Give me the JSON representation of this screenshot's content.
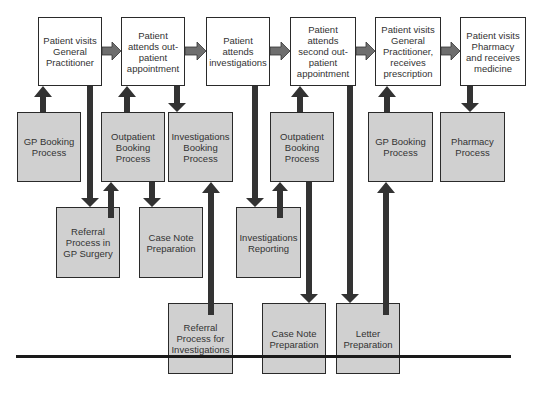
{
  "stages": [
    {
      "label": "Patient visits General Practitioner"
    },
    {
      "label": "Patient attends out-patient appointment"
    },
    {
      "label": "Patient attends investigations"
    },
    {
      "label": "Patient attends second out-patient appointment"
    },
    {
      "label": "Patient visits General Practitioner, receives prescription"
    },
    {
      "label": "Patient visits Pharmacy and receives medicine"
    }
  ],
  "processes": {
    "gp_booking_1": "GP Booking Process",
    "outpatient_booking_1": "Outpatient Booking Process",
    "investigations_booking": "Investigations Booking Process",
    "outpatient_booking_2": "Outpatient Booking Process",
    "gp_booking_2": "GP Booking Process",
    "pharmacy": "Pharmacy Process",
    "referral_gp": "Referral Process in GP Surgery",
    "case_note_1": "Case Note Preparation",
    "investigations_reporting": "Investigations Reporting",
    "referral_investigations": "Referral Process for Investigations",
    "case_note_2": "Case Note Preparation",
    "letter": "Letter Preparation"
  },
  "colors": {
    "stage_fill": "#ffffff",
    "process_fill": "#d0d0d0",
    "flow_arrow": "#6e6e6e",
    "link_arrow": "#333333"
  }
}
